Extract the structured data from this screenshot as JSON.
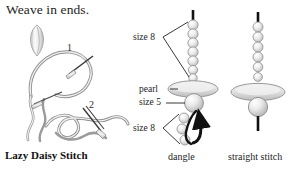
{
  "page": {
    "background_color": "#ffffff",
    "ink_color": "#1d1d1d",
    "bead_fill_color": "#e6e6e6",
    "bead_outline_color": "#8c8c8c",
    "thread_color": "#111111",
    "line_color": "#9a9a9a"
  },
  "heading": {
    "text": "Weave in ends."
  },
  "diagrams": {
    "lazy_daisy": {
      "caption": "Lazy Daisy Stitch",
      "step_numbers": [
        "1",
        "2"
      ],
      "elements": {
        "petal_name": "petal-shape",
        "needle_name": "needle",
        "loop_name": "thread-loop"
      }
    },
    "dangle": {
      "caption": "dangle",
      "labels": [
        {
          "text": "size 8",
          "target": "upper-bead-stack"
        },
        {
          "text": "pearl",
          "target": "pearl-disc"
        },
        {
          "text": "size 5",
          "target": "size-5-bead"
        },
        {
          "text": "size 8",
          "target": "dangle-bead-stack"
        }
      ],
      "upper_bead_count": 7,
      "dangle_bead_count": 3,
      "has_arrow": true
    },
    "straight_stitch": {
      "caption": "straight stitch",
      "upper_bead_count": 6,
      "has_pearl_disc": true,
      "has_lower_bead": true
    }
  }
}
